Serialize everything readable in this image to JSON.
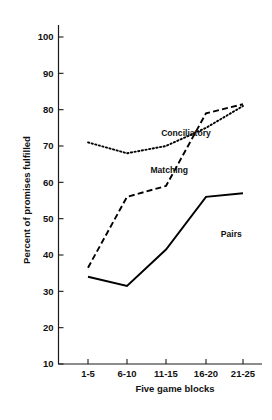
{
  "chart_data": {
    "type": "line",
    "title": "",
    "subtitle": "",
    "xlabel": "Five game blocks",
    "ylabel": "Percent of promises fulfilled",
    "categories": [
      "1-5",
      "6-10",
      "11-15",
      "16-20",
      "21-25"
    ],
    "xlim": [
      0,
      4
    ],
    "ylim": [
      10,
      100
    ],
    "yticks": [
      10,
      20,
      30,
      40,
      50,
      60,
      70,
      80,
      90,
      100
    ],
    "ytick_labels": [
      "10",
      "20",
      "30",
      "40",
      "50",
      "60",
      "70",
      "80",
      "90",
      "100"
    ],
    "grid": false,
    "legend_position": "inline-labels",
    "series": [
      {
        "name": "Conciliatory",
        "style": "dotted",
        "color": "#000000",
        "values": [
          71,
          68,
          70,
          75,
          81
        ],
        "label_x": 2.5,
        "label_y": 72.8
      },
      {
        "name": "Matching",
        "style": "dashed",
        "color": "#000000",
        "values": [
          36.5,
          56,
          59,
          79,
          81.5
        ],
        "label_x": 1.6,
        "label_y": 62.5
      },
      {
        "name": "Pairs",
        "style": "solid",
        "color": "#000000",
        "values": [
          34,
          31.5,
          41.5,
          56,
          57
        ],
        "label_x": 3.4,
        "label_y": 45
      }
    ],
    "annotations": [
      {
        "text": "Conciliatory",
        "series": "Conciliatory"
      },
      {
        "text": "Matching",
        "series": "Matching"
      },
      {
        "text": "Pairs",
        "series": "Pairs"
      }
    ]
  }
}
